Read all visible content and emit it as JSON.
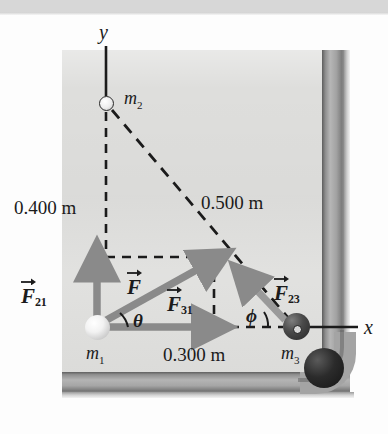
{
  "figure": {
    "kind": "physics-force-diagram",
    "axes": {
      "y_label": "y",
      "x_label": "x"
    },
    "masses": [
      {
        "id": "m1",
        "label": "m",
        "sub": "1",
        "shade": "light"
      },
      {
        "id": "m2",
        "label": "m",
        "sub": "2",
        "shade": "open-circle"
      },
      {
        "id": "m3",
        "label": "m",
        "sub": "3",
        "shade": "dark"
      }
    ],
    "dimensions": [
      {
        "id": "vertical",
        "text": "0.400 m"
      },
      {
        "id": "hypotenuse",
        "text": "0.500 m"
      },
      {
        "id": "horizontal",
        "text": "0.300 m"
      }
    ],
    "vectors": [
      {
        "id": "F21",
        "name": "F",
        "sub": "21"
      },
      {
        "id": "F",
        "name": "F",
        "sub": ""
      },
      {
        "id": "F31",
        "name": "F",
        "sub": "31"
      },
      {
        "id": "F23",
        "name": "F",
        "sub": "23"
      }
    ],
    "angles": [
      {
        "id": "theta",
        "symbol": "θ"
      },
      {
        "id": "phi",
        "symbol": "ϕ"
      }
    ],
    "colors": {
      "felt": "#dededc",
      "rail": "#a4a4a4",
      "vector_arrow": "#8a8a8a",
      "dashed_line": "#1b1b1b",
      "text": "#1b1b1b",
      "mass_dark": "#262626",
      "mass_light": "#f2f2f2"
    }
  }
}
